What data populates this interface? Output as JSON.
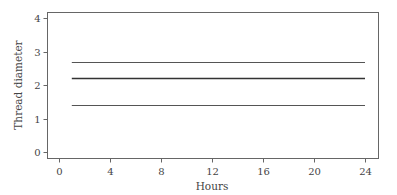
{
  "chart_data": {
    "type": "line",
    "title": "",
    "xlabel": "Hours",
    "ylabel": "Thread diameter",
    "xlim": [
      -1,
      25
    ],
    "ylim": [
      -0.2,
      4.2
    ],
    "xticks": [
      0,
      4,
      8,
      12,
      16,
      20,
      24
    ],
    "yticks": [
      0,
      1,
      2,
      3,
      4
    ],
    "grid": false,
    "legend": "none",
    "series": [
      {
        "name": "upper",
        "x": [
          1,
          24
        ],
        "y": [
          2.7,
          2.7
        ],
        "color": "#555555"
      },
      {
        "name": "center",
        "x": [
          1,
          24
        ],
        "y": [
          2.2,
          2.2
        ],
        "color": "#333333"
      },
      {
        "name": "lower",
        "x": [
          1,
          24
        ],
        "y": [
          1.4,
          1.4
        ],
        "color": "#555555"
      }
    ]
  }
}
